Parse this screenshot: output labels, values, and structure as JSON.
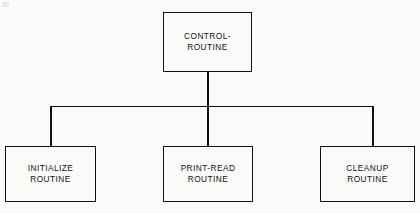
{
  "diagram": {
    "type": "hierarchy-chart",
    "background_color": "#fbfbfa",
    "line_color": "#121212",
    "text_color": "#101010",
    "nodes": [
      {
        "id": "control",
        "role": "root",
        "line1": "CONTROL-",
        "line2": "ROUTINE"
      },
      {
        "id": "initialize",
        "role": "child",
        "line1": "INITIALIZE",
        "line2": "ROUTINE"
      },
      {
        "id": "print-read",
        "role": "child",
        "line1": "PRINT-READ",
        "line2": "ROUTINE"
      },
      {
        "id": "cleanup",
        "role": "child",
        "line1": "CLEANUP",
        "line2": "ROUTINE"
      }
    ],
    "connectors": [
      {
        "id": "control-down",
        "from": "control",
        "to": "bus",
        "orientation": "vertical"
      },
      {
        "id": "bus",
        "from": "initialize-branch",
        "to": "cleanup-branch",
        "orientation": "horizontal"
      },
      {
        "id": "left-down",
        "from": "bus",
        "to": "initialize",
        "orientation": "vertical"
      },
      {
        "id": "right-down",
        "from": "bus",
        "to": "cleanup",
        "orientation": "vertical"
      }
    ]
  }
}
